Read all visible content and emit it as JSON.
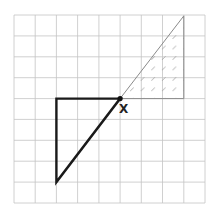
{
  "diagram": {
    "grid": {
      "columns": 9,
      "rows": 9,
      "line_color": "#bdbdbd"
    },
    "point_label": "X",
    "bold_triangle": {
      "stroke": "#1a1a1a",
      "description": "right triangle: horizontal leg 3 units, vertical leg 4 units, hypotenuse ending at X"
    },
    "shaded_triangle": {
      "stroke": "#8a8a8a",
      "hatch_color": "#9a9a9a",
      "description": "image of bold triangle rotated 180° about X, hatched"
    }
  }
}
